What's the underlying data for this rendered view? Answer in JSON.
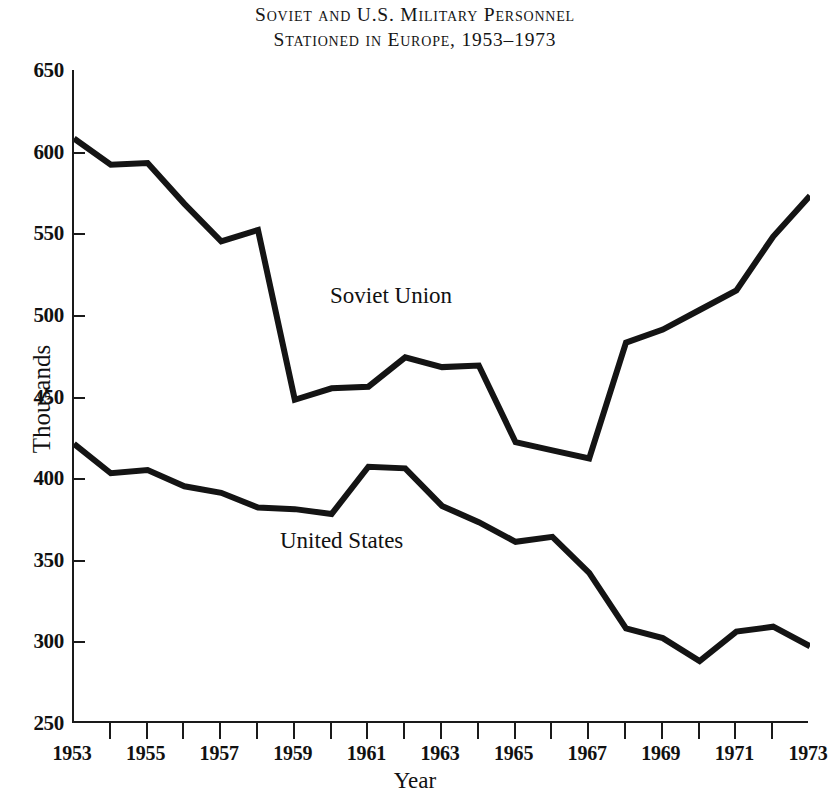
{
  "title": {
    "line1": "Soviet and U.S. Military Personnel",
    "line2": "Stationed in Europe, 1953–1973"
  },
  "axis": {
    "ylabel": "Thousands",
    "xlabel": "Year",
    "ytick_labels": [
      "650",
      "600",
      "550",
      "500",
      "450",
      "400",
      "350",
      "300",
      "250"
    ],
    "xtick_labels": [
      "1953",
      "1955",
      "1957",
      "1959",
      "1961",
      "1963",
      "1965",
      "1967",
      "1969",
      "1971",
      "1973"
    ]
  },
  "annotations": {
    "soviet": "Soviet Union",
    "united_states": "United States"
  },
  "colors": {
    "line": "#141414",
    "axis": "#1a1a1a",
    "background": "#ffffff"
  },
  "chart_data": {
    "type": "line",
    "title": "Soviet and U.S. Military Personnel Stationed in Europe, 1953–1973",
    "xlabel": "Year",
    "ylabel": "Thousands",
    "xlim": [
      1953,
      1973
    ],
    "ylim": [
      250,
      650
    ],
    "ytick_step": 50,
    "xtick_step": 1,
    "xtick_label_step": 2,
    "grid": false,
    "legend": "inline-annotations",
    "x": [
      1953,
      1954,
      1955,
      1956,
      1957,
      1958,
      1959,
      1960,
      1961,
      1962,
      1963,
      1964,
      1965,
      1966,
      1967,
      1968,
      1969,
      1970,
      1971,
      1972,
      1973
    ],
    "series": [
      {
        "name": "Soviet Union",
        "values": [
          608,
          592,
          593,
          568,
          545,
          552,
          448,
          455,
          456,
          474,
          468,
          469,
          422,
          417,
          412,
          483,
          491,
          503,
          515,
          548,
          573
        ]
      },
      {
        "name": "United States",
        "values": [
          421,
          403,
          405,
          395,
          391,
          382,
          381,
          378,
          407,
          406,
          383,
          373,
          361,
          364,
          342,
          308,
          302,
          288,
          306,
          309,
          297
        ]
      }
    ]
  }
}
